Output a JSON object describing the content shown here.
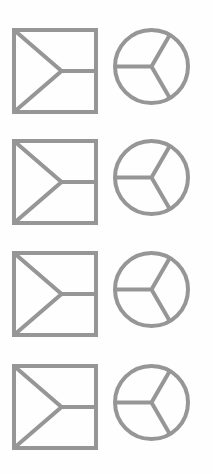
{
  "canvas": {
    "width": 213,
    "height": 474,
    "background_color": "#fefefe"
  },
  "style": {
    "stroke_color": "#969696",
    "stroke_width": 4,
    "fill": "none",
    "line_join": "miter",
    "line_cap": "butt"
  },
  "layout": {
    "rows": 4,
    "columns": 2,
    "row_pitch_px": 112,
    "first_row_top_px": 28,
    "column_tops_px": [
      28,
      139,
      251,
      364
    ],
    "square_left_px": 14,
    "circle_left_px": 115
  },
  "glyphs": {
    "square": {
      "name": "square-with-three-spoke-y",
      "description": "Square outline containing three straight lines radiating from an interior vertex to the top-left corner, the bottom-left corner, and the midpoint of the right edge.",
      "size_px": 82,
      "vertex_fraction_x": 0.58,
      "vertex_fraction_y": 0.5,
      "spoke_targets": [
        "top-left-corner",
        "bottom-left-corner",
        "right-edge-midpoint"
      ]
    },
    "circle": {
      "name": "circle-with-three-spoke-y",
      "description": "Circle outline containing three spokes radiating from the center at 180 degrees, 300 degrees and 60 degrees, resembling an inverted peace or radiation mark.",
      "diameter_px": 73,
      "spoke_angles_deg": [
        180,
        300,
        60
      ]
    }
  },
  "rows": [
    {
      "index": 1,
      "items": [
        {
          "shape": "square",
          "label": "square-glyph"
        },
        {
          "shape": "circle",
          "label": "circle-glyph"
        }
      ]
    },
    {
      "index": 2,
      "items": [
        {
          "shape": "square",
          "label": "square-glyph"
        },
        {
          "shape": "circle",
          "label": "circle-glyph"
        }
      ]
    },
    {
      "index": 3,
      "items": [
        {
          "shape": "square",
          "label": "square-glyph"
        },
        {
          "shape": "circle",
          "label": "circle-glyph"
        }
      ]
    },
    {
      "index": 4,
      "items": [
        {
          "shape": "square",
          "label": "square-glyph"
        },
        {
          "shape": "circle",
          "label": "circle-glyph"
        }
      ]
    }
  ]
}
